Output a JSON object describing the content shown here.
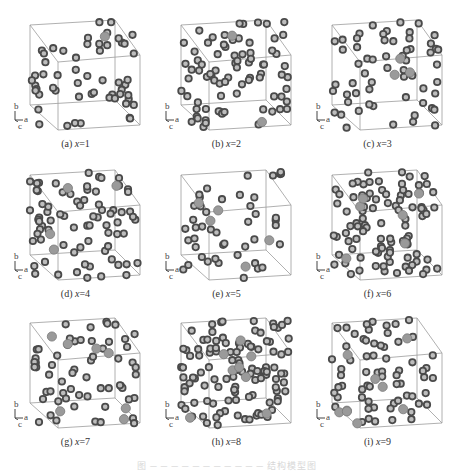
{
  "figure": {
    "panels": [
      {
        "id": "a",
        "label": "(a) ",
        "var": "x",
        "eq": "=1",
        "value": 1
      },
      {
        "id": "b",
        "label": "(b) ",
        "var": "x",
        "eq": "=2",
        "value": 2
      },
      {
        "id": "c",
        "label": "(c) ",
        "var": "x",
        "eq": "=3",
        "value": 3
      },
      {
        "id": "d",
        "label": "(d) ",
        "var": "x",
        "eq": "=4",
        "value": 4
      },
      {
        "id": "e",
        "label": "(e) ",
        "var": "x",
        "eq": "=5",
        "value": 5
      },
      {
        "id": "f",
        "label": "(f) ",
        "var": "x",
        "eq": "=6",
        "value": 6
      },
      {
        "id": "g",
        "label": "(g) ",
        "var": "x",
        "eq": "=7",
        "value": 7
      },
      {
        "id": "h",
        "label": "(h) ",
        "var": "x",
        "eq": "=8",
        "value": 8
      },
      {
        "id": "i",
        "label": "(i) ",
        "var": "x",
        "eq": "=9",
        "value": 9
      }
    ],
    "axes_labels": {
      "b": "b",
      "a": "a",
      "c": "c"
    },
    "caption": "图 ─ ─ ─ ─ ─ ─ ─ ─ ─ ─ ─ 结构模型图",
    "colors": {
      "atom_dark": "#4a4a4a",
      "atom_light": "#9a9a9a",
      "cell_edge": "#9c9c9c"
    }
  }
}
